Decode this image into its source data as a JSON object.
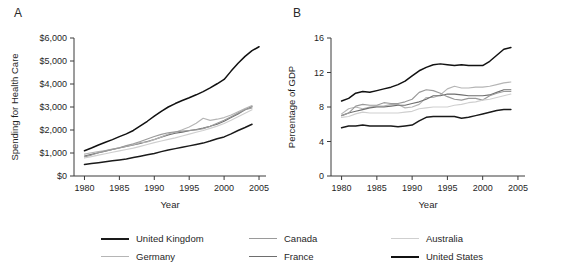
{
  "figure": {
    "panel_a_label": "A",
    "panel_b_label": "B"
  },
  "legend": {
    "items": [
      {
        "label": "United Kingdom",
        "color": "#1a1a1a"
      },
      {
        "label": "Canada",
        "color": "#9a9a9a"
      },
      {
        "label": "Australia",
        "color": "#cfcfcf"
      },
      {
        "label": "Germany",
        "color": "#b5b5b5"
      },
      {
        "label": "France",
        "color": "#6e6e6e"
      },
      {
        "label": "United States",
        "color": "#111111"
      }
    ]
  },
  "chart_data": [
    {
      "type": "line",
      "panel": "A",
      "title": "",
      "xlabel": "Year",
      "ylabel": "Spending for Health Care",
      "xlim": [
        1978.5,
        2006
      ],
      "ylim": [
        0,
        6000
      ],
      "xticks": [
        1980,
        1985,
        1990,
        1995,
        2000,
        2005
      ],
      "xticklabels": [
        "1980",
        "1985",
        "1990",
        "1995",
        "2000",
        "2005"
      ],
      "yticks": [
        0,
        1000,
        2000,
        3000,
        4000,
        5000,
        6000
      ],
      "yticklabels": [
        "$0",
        "$1,000",
        "$2,000",
        "$3,000",
        "$4,000",
        "$5,000",
        "$6,000"
      ],
      "grid": false,
      "legend_position": "below-figure",
      "x": [
        1980,
        1981,
        1982,
        1983,
        1984,
        1985,
        1986,
        1987,
        1988,
        1989,
        1990,
        1991,
        1992,
        1993,
        1994,
        1995,
        1996,
        1997,
        1998,
        1999,
        2000,
        2001,
        2002,
        2003,
        2004,
        2005
      ],
      "series": [
        {
          "name": "United States",
          "color": "#111111",
          "values": [
            1100,
            1220,
            1350,
            1470,
            1580,
            1710,
            1830,
            1980,
            2180,
            2380,
            2600,
            2810,
            3000,
            3150,
            3280,
            3400,
            3530,
            3670,
            3830,
            4010,
            4200,
            4560,
            4900,
            5200,
            5450,
            5620
          ]
        },
        {
          "name": "France",
          "color": "#6e6e6e",
          "values": [
            870,
            940,
            1010,
            1080,
            1150,
            1220,
            1290,
            1350,
            1420,
            1500,
            1590,
            1690,
            1790,
            1860,
            1910,
            1970,
            2020,
            2080,
            2160,
            2250,
            2380,
            2540,
            2700,
            2880,
            3020,
            null
          ]
        },
        {
          "name": "Germany",
          "color": "#b5b5b5",
          "values": [
            950,
            1010,
            1060,
            1110,
            1170,
            1230,
            1300,
            1360,
            1450,
            1480,
            1580,
            1700,
            1830,
            1900,
            2010,
            2130,
            2290,
            2510,
            2420,
            2470,
            2540,
            2650,
            2790,
            2930,
            3060,
            null
          ]
        },
        {
          "name": "Canada",
          "color": "#9a9a9a",
          "values": [
            830,
            910,
            1010,
            1090,
            1160,
            1230,
            1320,
            1400,
            1500,
            1610,
            1720,
            1810,
            1880,
            1920,
            1950,
            1980,
            2000,
            2060,
            2160,
            2290,
            2420,
            2580,
            2740,
            2880,
            2960,
            null
          ]
        },
        {
          "name": "Australia",
          "color": "#cfcfcf",
          "values": [
            780,
            840,
            910,
            970,
            1030,
            1090,
            1150,
            1210,
            1290,
            1370,
            1450,
            1520,
            1590,
            1660,
            1740,
            1820,
            1900,
            1980,
            2070,
            2170,
            2280,
            2420,
            2580,
            2730,
            2880,
            null
          ]
        },
        {
          "name": "United Kingdom",
          "color": "#1a1a1a",
          "values": [
            500,
            540,
            580,
            620,
            660,
            700,
            740,
            800,
            860,
            920,
            980,
            1060,
            1130,
            1190,
            1250,
            1310,
            1370,
            1430,
            1520,
            1620,
            1700,
            1830,
            1980,
            2110,
            2250,
            null
          ]
        }
      ]
    },
    {
      "type": "line",
      "panel": "B",
      "title": "",
      "xlabel": "Year",
      "ylabel": "Percentage of GDP",
      "xlim": [
        1978.5,
        2006
      ],
      "ylim": [
        0,
        16
      ],
      "xticks": [
        1980,
        1985,
        1990,
        1995,
        2000,
        2005
      ],
      "xticklabels": [
        "1980",
        "1985",
        "1990",
        "1995",
        "2000",
        "2005"
      ],
      "yticks": [
        0,
        4,
        8,
        12,
        16
      ],
      "yticklabels": [
        "0",
        "4",
        "8",
        "12",
        "16"
      ],
      "grid": false,
      "legend_position": "below-figure",
      "x": [
        1980,
        1981,
        1982,
        1983,
        1984,
        1985,
        1986,
        1987,
        1988,
        1989,
        1990,
        1991,
        1992,
        1993,
        1994,
        1995,
        1996,
        1997,
        1998,
        1999,
        2000,
        2001,
        2002,
        2003,
        2004
      ],
      "series": [
        {
          "name": "United States",
          "color": "#111111",
          "values": [
            8.7,
            9.0,
            9.6,
            9.8,
            9.7,
            9.9,
            10.1,
            10.3,
            10.6,
            11.0,
            11.6,
            12.2,
            12.6,
            12.9,
            13.0,
            12.9,
            12.8,
            12.9,
            12.8,
            12.8,
            12.8,
            13.3,
            14.0,
            14.7,
            14.9
          ]
        },
        {
          "name": "Germany",
          "color": "#b5b5b5",
          "values": [
            7.2,
            7.8,
            8.0,
            7.8,
            8.0,
            8.1,
            8.1,
            8.3,
            8.3,
            7.9,
            8.0,
            8.3,
            9.1,
            9.1,
            9.4,
            10.1,
            10.4,
            10.2,
            10.2,
            10.3,
            10.3,
            10.4,
            10.6,
            10.8,
            10.9
          ]
        },
        {
          "name": "France",
          "color": "#6e6e6e",
          "values": [
            7.0,
            7.3,
            7.5,
            7.7,
            7.9,
            8.0,
            8.0,
            8.1,
            8.2,
            8.2,
            8.4,
            8.6,
            8.9,
            9.3,
            9.3,
            9.5,
            9.5,
            9.4,
            9.3,
            9.3,
            9.3,
            9.4,
            9.7,
            10.0,
            10.0
          ]
        },
        {
          "name": "Canada",
          "color": "#9a9a9a",
          "values": [
            7.0,
            7.3,
            8.1,
            8.3,
            8.2,
            8.2,
            8.5,
            8.4,
            8.4,
            8.6,
            8.9,
            9.7,
            10.0,
            9.9,
            9.6,
            9.2,
            8.9,
            8.8,
            9.0,
            9.0,
            8.8,
            9.3,
            9.6,
            9.8,
            9.8
          ]
        },
        {
          "name": "Australia",
          "color": "#cfcfcf",
          "values": [
            6.8,
            6.9,
            7.2,
            7.4,
            7.3,
            7.3,
            7.3,
            7.3,
            7.3,
            7.4,
            7.5,
            7.8,
            7.9,
            8.0,
            8.0,
            8.0,
            8.2,
            8.3,
            8.5,
            8.6,
            8.8,
            8.9,
            9.1,
            9.3,
            9.5
          ]
        },
        {
          "name": "United Kingdom",
          "color": "#1a1a1a",
          "values": [
            5.6,
            5.8,
            5.8,
            5.9,
            5.8,
            5.8,
            5.8,
            5.8,
            5.7,
            5.8,
            5.9,
            6.4,
            6.8,
            6.9,
            6.9,
            6.9,
            6.9,
            6.7,
            6.8,
            7.0,
            7.2,
            7.4,
            7.6,
            7.7,
            7.7
          ]
        }
      ]
    }
  ]
}
